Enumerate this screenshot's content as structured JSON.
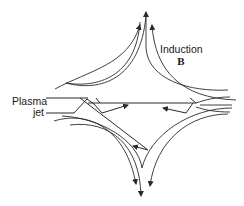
{
  "diagram": {
    "labels": {
      "plasma_jet_line1": "Plasma",
      "plasma_jet_line2": "jet",
      "induction_line1": "Induction",
      "induction_symbol": "B"
    },
    "colors": {
      "stroke": "#2a2a2a",
      "background": "#ffffff"
    }
  }
}
